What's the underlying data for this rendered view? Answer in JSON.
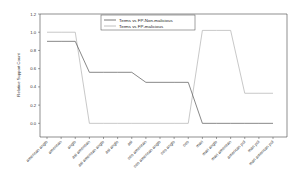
{
  "chart_data": {
    "type": "line",
    "title": "",
    "xlabel": "",
    "ylabel": "Relative Support Count",
    "ylim": [
      -0.15,
      1.2
    ],
    "yticks": [
      "1.2",
      "1.0",
      "0.8",
      "0.6",
      "0.4",
      "0.2",
      "0.0"
    ],
    "grid": false,
    "legend_position": "top-right",
    "categories": [
      "american anglo",
      "american",
      "anglo",
      "asi american",
      "asi american anglo",
      "asi anglo",
      "asi",
      "oeo american",
      "oeo american anglo",
      "oeo anglo",
      "oeo",
      "mari",
      "mari anglo",
      "mari american",
      "american pol",
      "mari pol",
      "mari american pol"
    ],
    "series": [
      {
        "name": "Terms vs FP-Non-malicious",
        "color": "#555555",
        "values": [
          0.9,
          0.9,
          0.9,
          0.56,
          0.56,
          0.56,
          0.56,
          0.45,
          0.45,
          0.45,
          0.45,
          0.0,
          0.0,
          0.0,
          0.0,
          0.0,
          0.0
        ]
      },
      {
        "name": "Terms vs FP-malicious",
        "color": "#b0b0b0",
        "values": [
          1.0,
          1.0,
          1.0,
          0.0,
          0.0,
          0.0,
          0.0,
          0.0,
          0.0,
          0.0,
          0.0,
          1.02,
          1.02,
          1.02,
          0.33,
          0.33,
          0.33
        ]
      }
    ]
  },
  "legend": {
    "items": [
      {
        "label": "Terms vs FP-Non-malicious",
        "color": "#555555"
      },
      {
        "label": "Terms vs FP-malicious",
        "color": "#b0b0b0"
      }
    ]
  }
}
